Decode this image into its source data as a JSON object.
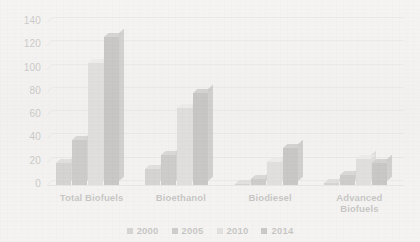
{
  "chart_data": {
    "type": "bar",
    "title": "",
    "xlabel": "",
    "ylabel": "",
    "ylim": [
      0,
      140
    ],
    "ytick_step": 20,
    "yticks": [
      "0",
      "20",
      "40",
      "60",
      "80",
      "100",
      "120",
      "140"
    ],
    "grid": true,
    "legend_position": "bottom",
    "categories": [
      "Total Biofuels",
      "Bioethanol",
      "Biodiesel",
      "Advanced Biofuels"
    ],
    "category_lines": [
      [
        "Total Biofuels"
      ],
      [
        "Bioethanol"
      ],
      [
        "Biodiesel"
      ],
      [
        "Advanced",
        "Biofuels"
      ]
    ],
    "series": [
      {
        "name": "2000",
        "color": "#7a7a7a",
        "values": [
          19,
          14,
          1,
          2
        ]
      },
      {
        "name": "2005",
        "color": "#5d5d5d",
        "values": [
          39,
          26,
          5,
          9
        ]
      },
      {
        "name": "2010",
        "color": "#a8a8a8",
        "values": [
          105,
          66,
          20,
          22
        ]
      },
      {
        "name": "2014",
        "color": "#4a4a4a",
        "values": [
          127,
          79,
          32,
          19
        ]
      }
    ]
  },
  "colors": {
    "background": "#f4f3f1",
    "gridline": "#d2d2d0",
    "tick_text": "#4d4d4d",
    "category_text": "#3f3f3f",
    "legend_text": "#3c3c3c"
  }
}
